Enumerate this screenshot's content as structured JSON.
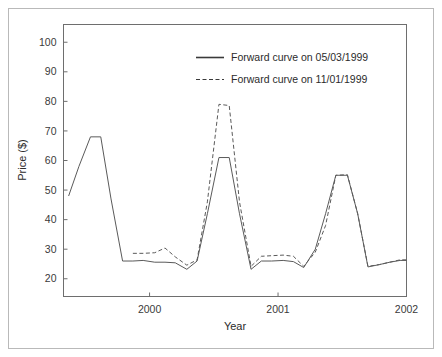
{
  "chart_data": {
    "type": "line",
    "title": "",
    "xlabel": "Year",
    "ylabel": "Price ($)",
    "xlim": [
      1999.33,
      2002.0
    ],
    "ylim": [
      14.0,
      106.0
    ],
    "grid": false,
    "legend_position": "upper-center-right",
    "xticks": [
      "2000",
      "2001",
      "2002"
    ],
    "xtick_values": [
      2000,
      2001,
      2002
    ],
    "yticks": [
      "20",
      "30",
      "40",
      "50",
      "60",
      "70",
      "80",
      "90",
      "100"
    ],
    "ytick_values": [
      20,
      30,
      40,
      50,
      60,
      70,
      80,
      90,
      100
    ],
    "series": [
      {
        "name": "Forward curve on 05/03/1999",
        "style": "solid",
        "x": [
          1999.37,
          1999.45,
          1999.54,
          1999.62,
          1999.7,
          1999.79,
          1999.87,
          1999.95,
          2000.04,
          2000.12,
          2000.2,
          2000.29,
          2000.37,
          2000.45,
          2000.54,
          2000.62,
          2000.7,
          2000.79,
          2000.87,
          2000.95,
          2001.04,
          2001.12,
          2001.2,
          2001.29,
          2001.37,
          2001.45,
          2001.54,
          2001.62,
          2001.7,
          2001.79,
          2001.87,
          2001.95,
          2002.0
        ],
        "y": [
          48.0,
          58.0,
          68.0,
          68.0,
          47.0,
          26.0,
          26.0,
          26.2,
          25.6,
          25.6,
          25.4,
          23.2,
          26.0,
          42.0,
          61.0,
          61.0,
          42.0,
          23.2,
          26.0,
          26.0,
          26.2,
          25.8,
          23.8,
          30.0,
          42.0,
          55.0,
          55.0,
          42.0,
          24.0,
          24.8,
          25.6,
          26.2,
          26.2
        ]
      },
      {
        "name": "Forward curve on 11/01/1999",
        "style": "dashed",
        "x": [
          1999.87,
          1999.95,
          2000.04,
          2000.12,
          2000.2,
          2000.29,
          2000.37,
          2000.45,
          2000.54,
          2000.62,
          2000.7,
          2000.79,
          2000.87,
          2000.95,
          2001.04,
          2001.12,
          2001.2,
          2001.29,
          2001.37,
          2001.45,
          2001.54,
          2001.62,
          2001.7,
          2001.79,
          2001.87,
          2001.95,
          2002.0
        ],
        "y": [
          28.6,
          28.6,
          28.8,
          30.4,
          27.4,
          24.6,
          26.4,
          46.0,
          79.0,
          78.6,
          46.0,
          24.2,
          27.6,
          27.8,
          28.0,
          27.6,
          24.2,
          29.0,
          38.0,
          55.0,
          55.2,
          42.0,
          24.2,
          24.8,
          25.6,
          26.4,
          26.4
        ]
      }
    ],
    "legend_entries": [
      {
        "label": "Forward curve on 05/03/1999",
        "style": "solid"
      },
      {
        "label": "Forward curve on 11/01/1999",
        "style": "dashed"
      }
    ],
    "colors": {
      "line": "#5a5a5a",
      "axis": "#6e6e6e",
      "text": "#2b2b2b",
      "frame": "#b9b9b9",
      "background": "#ffffff"
    }
  }
}
